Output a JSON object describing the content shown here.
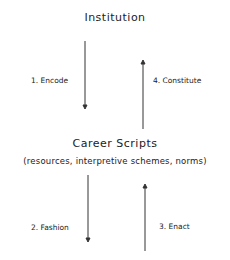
{
  "diagram": {
    "top_node": {
      "label": "Institution"
    },
    "bottom_node": {
      "label": "Career Scripts",
      "sublabel": "(resources, interpretive schemes, norms)"
    },
    "arrows": [
      {
        "id": 1,
        "label": "1. Encode",
        "direction": "down",
        "from": "Institution",
        "to": "Career Scripts"
      },
      {
        "id": 4,
        "label": "4. Constitute",
        "direction": "up",
        "from": "Career Scripts",
        "to": "Institution"
      },
      {
        "id": 2,
        "label": "2. Fashion",
        "direction": "down",
        "from": "Career Scripts",
        "to": "Action"
      },
      {
        "id": 3,
        "label": "3. Enact",
        "direction": "up",
        "from": "Action",
        "to": "Career Scripts"
      }
    ]
  }
}
